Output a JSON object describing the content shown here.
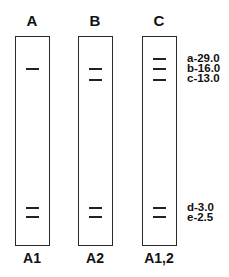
{
  "figure": {
    "lanes": [
      {
        "id": "A",
        "top_label": "A",
        "bottom_label": "A1"
      },
      {
        "id": "B",
        "top_label": "B",
        "bottom_label": "A2"
      },
      {
        "id": "C",
        "top_label": "C",
        "bottom_label": "A1,2"
      }
    ],
    "markers": [
      {
        "label": "a-29.0"
      },
      {
        "label": "b-16.0"
      },
      {
        "label": "c-13.0"
      },
      {
        "label": "d-3.0"
      },
      {
        "label": "e-2.5"
      }
    ],
    "colors": {
      "line": "#222222",
      "background": "#ffffff"
    }
  }
}
